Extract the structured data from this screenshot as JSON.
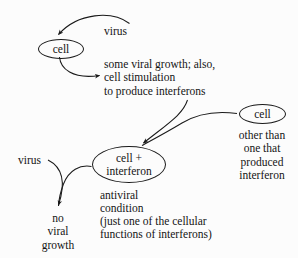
{
  "diagram": {
    "background_color": "#fcfcfc",
    "stroke_color": "#1a1a1a",
    "text_color": "#141414",
    "nodes": [
      {
        "id": "cell_top",
        "label": "cell",
        "shape": "ellipse"
      },
      {
        "id": "cell_right",
        "label": "cell",
        "shape": "ellipse"
      },
      {
        "id": "cell_ifn",
        "label": "cell +\ninterferon",
        "shape": "ellipse"
      }
    ],
    "labels": {
      "virus_top": "virus",
      "stimulation": "some viral growth; also,\ncell stimulation\nto produce interferons",
      "other_than": "other than\none that\nproduced\ninterferon",
      "virus_left": "virus",
      "no_viral_growth": "no\nviral\ngrowth",
      "antiviral_condition": "antiviral\ncondition",
      "just_one_of": "(just one of the cellular\nfunctions of interferons)"
    },
    "arrows": [
      {
        "id": "virus-to-cell",
        "from": "virus_top",
        "to": "cell_top",
        "arrowhead": true
      },
      {
        "id": "cell-to-stimulation",
        "from": "cell_top",
        "to": "stimulation",
        "arrowhead": true
      },
      {
        "id": "stimulation-to-cellifn",
        "from": "stimulation",
        "to": "cell_ifn",
        "arrowhead": true
      },
      {
        "id": "cellright-to-cellifn",
        "from": "cell_right",
        "to": "cell_ifn",
        "arrowhead": false
      },
      {
        "id": "virusleft-to-nogrowth",
        "from": "virus_left",
        "to": "no_viral_growth",
        "arrowhead": true
      },
      {
        "id": "cellifn-to-nogrowth",
        "from": "cell_ifn",
        "to": "no_viral_growth",
        "arrowhead": false
      }
    ]
  }
}
